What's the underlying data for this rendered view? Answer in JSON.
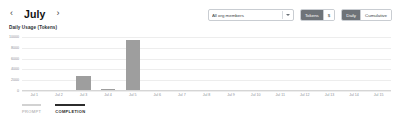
{
  "header": {
    "prev_label": "‹",
    "next_label": "›",
    "month": "July",
    "member_filter": {
      "value": "All org members",
      "placeholder": "All org members"
    },
    "unit_toggle": {
      "options": [
        "Tokens",
        "$"
      ],
      "selected": "Tokens"
    },
    "range_toggle": {
      "options": [
        "Daily",
        "Cumulative"
      ],
      "selected": "Daily"
    }
  },
  "legend": {
    "items": [
      {
        "label": "PROMPT",
        "active": false
      },
      {
        "label": "COMPLETION",
        "active": true
      }
    ]
  },
  "colors": {
    "bar": "#9e9e9e",
    "toggle_active_bg": "#6e7378",
    "grid": "#ededed",
    "axis_text": "#8b9096"
  },
  "chart_data": {
    "type": "bar",
    "title": "Daily Usage (Tokens)",
    "xlabel": "",
    "ylabel": "",
    "grid": true,
    "legend_position": "bottom-left",
    "ylim": [
      0,
      10000
    ],
    "yticks": [
      0,
      2000,
      4000,
      6000,
      8000,
      10000
    ],
    "ytick_labels": [
      "0",
      "2000",
      "4000",
      "6000",
      "8000",
      "10000"
    ],
    "categories": [
      "Jul 1",
      "Jul 2",
      "Jul 3",
      "Jul 4",
      "Jul 5",
      "Jul 6",
      "Jul 7",
      "Jul 8",
      "Jul 9",
      "Jul 10",
      "Jul 11",
      "Jul 12",
      "Jul 13",
      "Jul 14",
      "Jul 15"
    ],
    "series": [
      {
        "name": "COMPLETION",
        "values": [
          0,
          0,
          2600,
          200,
          9500,
          0,
          0,
          0,
          0,
          0,
          0,
          0,
          0,
          0,
          0
        ]
      }
    ]
  }
}
